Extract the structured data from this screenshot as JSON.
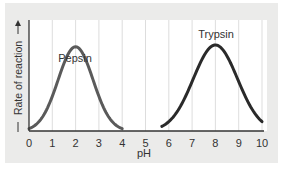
{
  "chart_data": {
    "type": "line",
    "title": "",
    "xlabel": "pH",
    "ylabel": "Rate of reaction",
    "ylabel_arrows": true,
    "xlim": [
      0,
      10
    ],
    "ylim": [
      0,
      1
    ],
    "xticks": [
      "0",
      "1",
      "2",
      "3",
      "4",
      "5",
      "6",
      "7",
      "8",
      "9",
      "10"
    ],
    "grid": {
      "vertical": true,
      "horizontal": false
    },
    "legend": "inline curve labels",
    "series": [
      {
        "name": "Pepsin",
        "color": "#5a5a5a",
        "x": [
          0,
          0.5,
          1,
          1.5,
          2,
          2.5,
          3,
          3.5,
          4
        ],
        "y": [
          0.02,
          0.15,
          0.45,
          0.8,
          0.98,
          0.8,
          0.45,
          0.15,
          0.02
        ]
      },
      {
        "name": "Trypsin",
        "color": "#2a2a2a",
        "x": [
          5.7,
          6,
          6.5,
          7,
          7.5,
          8,
          8.5,
          9,
          9.5,
          10
        ],
        "y": [
          0.02,
          0.08,
          0.3,
          0.62,
          0.9,
          1.0,
          0.9,
          0.6,
          0.25,
          0.03
        ]
      }
    ],
    "annotations": [
      {
        "text": "Pepsin",
        "x": 2,
        "y_above_peak": true
      },
      {
        "text": "Trypsin",
        "x": 8,
        "y_above_peak": true
      }
    ]
  },
  "labels": {
    "pepsin": "Pepsin",
    "trypsin": "Trypsin",
    "xlabel": "pH",
    "ylabel": "Rate of reaction"
  }
}
